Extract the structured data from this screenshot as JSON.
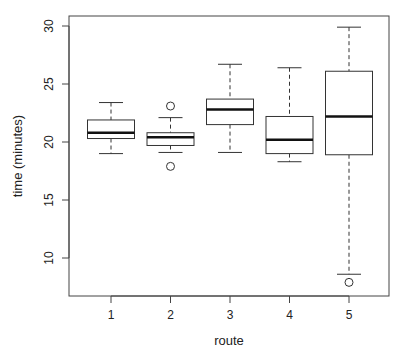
{
  "chart_data": {
    "type": "boxplot",
    "title": "",
    "xlabel": "route",
    "ylabel": "time (minutes)",
    "ylim": [
      7,
      31
    ],
    "yticks": [
      10,
      15,
      20,
      25,
      30
    ],
    "categories": [
      "1",
      "2",
      "3",
      "4",
      "5"
    ],
    "grid": false,
    "legend": null,
    "boxes": [
      {
        "label": "1",
        "whisker_low": 19.0,
        "q1": 20.3,
        "median": 20.8,
        "q3": 21.9,
        "whisker_high": 23.4,
        "outliers": []
      },
      {
        "label": "2",
        "whisker_low": 19.1,
        "q1": 19.7,
        "median": 20.4,
        "q3": 20.8,
        "whisker_high": 22.1,
        "outliers": [
          23.1,
          17.9
        ]
      },
      {
        "label": "3",
        "whisker_low": 19.1,
        "q1": 21.5,
        "median": 22.8,
        "q3": 23.7,
        "whisker_high": 26.7,
        "outliers": []
      },
      {
        "label": "4",
        "whisker_low": 18.3,
        "q1": 19.0,
        "median": 20.2,
        "q3": 22.2,
        "whisker_high": 26.4,
        "outliers": []
      },
      {
        "label": "5",
        "whisker_low": 8.6,
        "q1": 18.9,
        "median": 22.2,
        "q3": 26.1,
        "whisker_high": 29.9,
        "outliers": [
          7.9
        ]
      }
    ],
    "colors": {
      "box_fill": "#ffffff",
      "stroke": "#333333",
      "median": "#111111"
    }
  }
}
